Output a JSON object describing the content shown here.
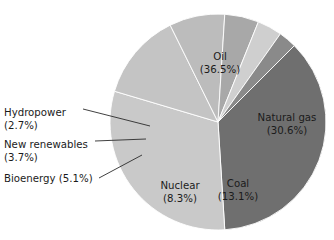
{
  "chart_data": {
    "type": "pie",
    "title": "",
    "subtitle": "",
    "xlabel": "",
    "ylabel": "",
    "legend_position": "none",
    "grid": false,
    "units": "percent",
    "total": 100.0,
    "categories": [
      "Oil",
      "Natural gas",
      "Coal",
      "Nuclear",
      "Bioenergy",
      "New renewables",
      "Hydropower"
    ],
    "values": [
      36.5,
      30.6,
      13.1,
      8.3,
      5.1,
      3.7,
      2.7
    ],
    "slices": [
      {
        "name": "Oil",
        "label": "Oil",
        "value": 36.5,
        "value_label": "(36.5%)",
        "color": "#6f6f6f",
        "label_placement": "inside",
        "label_x": 220,
        "label_y": 57
      },
      {
        "name": "Natural gas",
        "label": "Natural gas",
        "value": 30.6,
        "value_label": "(30.6%)",
        "color": "#c9c9c9",
        "label_placement": "inside",
        "label_x": 287,
        "label_y": 118
      },
      {
        "name": "Coal",
        "label": "Coal",
        "value": 13.1,
        "value_label": "(13.1%)",
        "color": "#c4c4c4",
        "label_placement": "inside",
        "label_x": 238,
        "label_y": 184
      },
      {
        "name": "Nuclear",
        "label": "Nuclear",
        "value": 8.3,
        "value_label": "(8.3%)",
        "color": "#bcbcbc",
        "label_placement": "inside",
        "label_x": 180,
        "label_y": 186
      },
      {
        "name": "Bioenergy",
        "label": "Bioenergy (5.1%)",
        "value": 5.1,
        "value_label": "(5.1%)",
        "color": "#a8a8a8",
        "label_placement": "outside",
        "label_x": 4,
        "label_y": 179
      },
      {
        "name": "New renewables",
        "label": "New renewables",
        "value": 3.7,
        "value_label": "(3.7%)",
        "color": "#cfcfcf",
        "label_placement": "outside",
        "label_x": 4,
        "label_y": 145
      },
      {
        "name": "Hydropower",
        "label": "Hydropower",
        "value": 2.7,
        "value_label": "(2.7%)",
        "color": "#8a8a8a",
        "label_placement": "outside",
        "label_x": 4,
        "label_y": 113
      }
    ]
  },
  "geometry": {
    "center_x": 218,
    "center_y": 122,
    "radius": 108,
    "start_angle_deg": 45
  }
}
